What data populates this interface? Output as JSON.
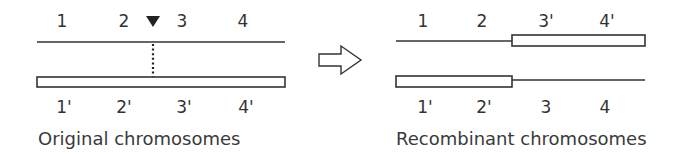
{
  "original": {
    "caption": "Original chromosomes",
    "top_labels": [
      "1",
      "2",
      "3",
      "4"
    ],
    "bottom_labels": [
      "1'",
      "2'",
      "3'",
      "4'"
    ],
    "crossover_marker": "triangle-down"
  },
  "transition": {
    "icon": "right-arrow-outline"
  },
  "recombinant": {
    "caption": "Recombinant chromosomes",
    "top_labels": [
      "1",
      "2",
      "3'",
      "4'"
    ],
    "bottom_labels": [
      "1'",
      "2'",
      "3",
      "4"
    ]
  },
  "colors": {
    "line": "#333333",
    "bar_fill": "#ffffff",
    "marker": "#222222"
  }
}
